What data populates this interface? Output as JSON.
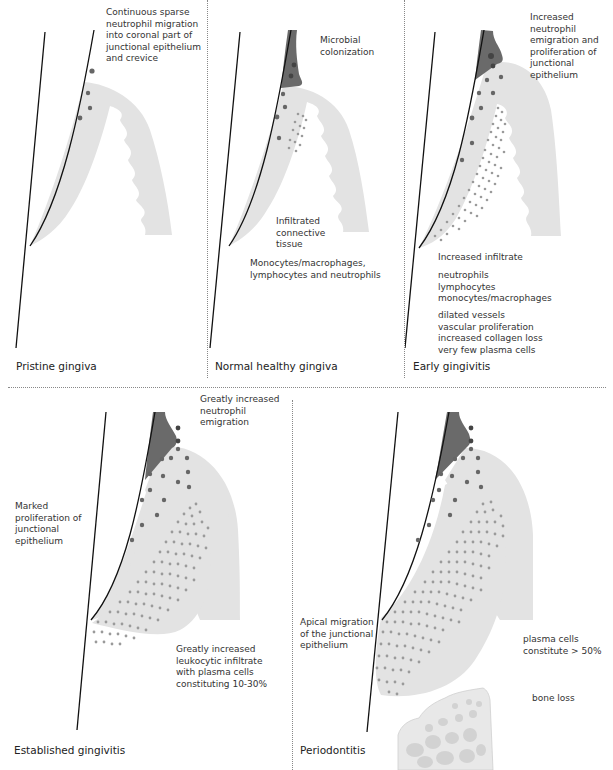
{
  "colors": {
    "tissue": "#e3e3e3",
    "plaque": "#6a6a6a",
    "cell_dot": "#9a9a9a",
    "line": "#111111",
    "bone": "#d6d6d6",
    "bone_light": "#e8e8e8",
    "text": "#333333"
  },
  "panels": [
    {
      "id": "pristine",
      "title": "Pristine gingiva",
      "labels": [
        "Continuous sparse\nneutrophil migration\ninto coronal part of\njunctional epithelium\nand crevice"
      ]
    },
    {
      "id": "normal",
      "title": "Normal healthy gingiva",
      "labels": [
        "Microbial\ncolonization",
        "Infiltrated\nconnective\ntissue",
        "Monocytes/macrophages,\nlymphocytes and neutrophils"
      ]
    },
    {
      "id": "early",
      "title": "Early gingivitis",
      "labels": [
        "Increased\nneutrophil\nemigration and\nproliferation of\njunctional\nepithelium",
        "Increased infiltrate",
        "neutrophils\nlymphocytes\nmonocytes/macrophages",
        "dilated vessels\nvascular proliferation\nincreased collagen loss\nvery few plasma cells"
      ]
    },
    {
      "id": "established",
      "title": "Established gingivitis",
      "labels": [
        "Greatly increased\nneutrophil\nemigration",
        "Marked\nproliferation of\njunctional\nepithelium",
        "Greatly increased\nleukocytic infiltrate\nwith plasma cells\nconstituting 10-30%"
      ]
    },
    {
      "id": "periodontitis",
      "title": "Periodontitis",
      "labels": [
        "Apical migration\nof the junctional\nepithelium",
        "plasma cells\nconstitute > 50%",
        "bone loss"
      ]
    }
  ]
}
